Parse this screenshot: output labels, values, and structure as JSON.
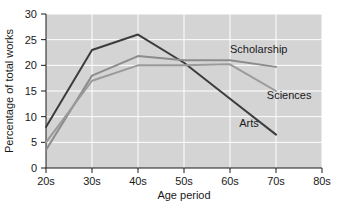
{
  "chart_data": {
    "type": "line",
    "title": "",
    "xlabel": "Age period",
    "ylabel": "Percentage of total works",
    "categories": [
      "20s",
      "30s",
      "40s",
      "50s",
      "60s",
      "70s",
      "80s"
    ],
    "x_tick_labels": [
      "20s",
      "30s",
      "40s",
      "50s",
      "60s",
      "70s",
      "80s"
    ],
    "y_tick_labels": [
      "0",
      "5",
      "10",
      "15",
      "20",
      "25",
      "30"
    ],
    "y_ticks": [
      0,
      5,
      10,
      15,
      20,
      25,
      30
    ],
    "ylim": [
      0,
      30
    ],
    "xlim": [
      "20s",
      "80s"
    ],
    "grid": true,
    "grid_color": "#ffffff",
    "plot_background": "#d4d4d4",
    "legend": "inline-labels",
    "legend_position": "inline-right",
    "series": [
      {
        "name": "Arts",
        "color": "#3c3c3c",
        "x": [
          "20s",
          "30s",
          "40s",
          "50s",
          "60s",
          "70s"
        ],
        "values": [
          8,
          23,
          26,
          20.5,
          13.5,
          6.5
        ]
      },
      {
        "name": "Scholarship",
        "color": "#8c8c8c",
        "x": [
          "20s",
          "30s",
          "40s",
          "50s",
          "60s",
          "70s"
        ],
        "values": [
          3.5,
          18,
          21.8,
          21,
          21,
          19.7
        ]
      },
      {
        "name": "Sciences",
        "color": "#9a9a9a",
        "x": [
          "20s",
          "30s",
          "40s",
          "50s",
          "60s",
          "70s"
        ],
        "values": [
          5,
          17,
          20,
          20,
          20.2,
          15
        ]
      }
    ],
    "annotations": [
      {
        "text": "Scholarship",
        "x": "60s",
        "y": 22.5
      },
      {
        "text": "Sciences",
        "x": "68s",
        "y": 13.5
      },
      {
        "text": "Arts",
        "x": "62s",
        "y": 8.0
      }
    ]
  }
}
